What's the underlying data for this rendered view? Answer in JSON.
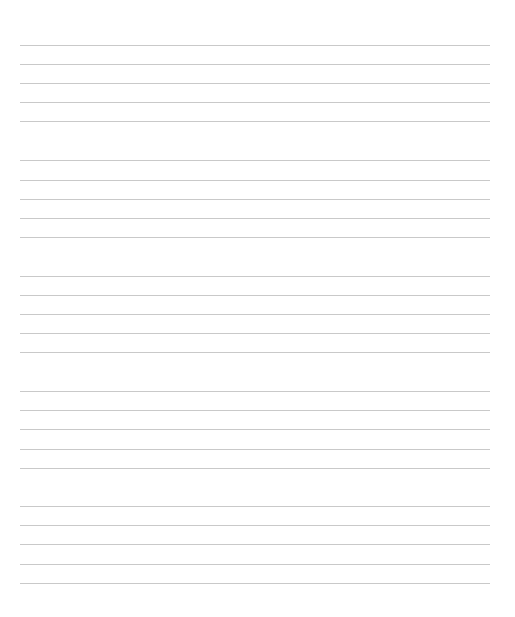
{
  "document": {
    "type": "blank-staff-paper",
    "line_color": "#c9c9c9",
    "background": "#ffffff",
    "staves": [
      {
        "top": 45,
        "lines": [
          0,
          19,
          38,
          57,
          76
        ]
      },
      {
        "top": 160,
        "lines": [
          0,
          20,
          39,
          58,
          77
        ]
      },
      {
        "top": 276,
        "lines": [
          0,
          19,
          38,
          57,
          76
        ]
      },
      {
        "top": 391,
        "lines": [
          0,
          19,
          38,
          58,
          77
        ]
      },
      {
        "top": 506,
        "lines": [
          0,
          19,
          38,
          58,
          77
        ]
      }
    ]
  }
}
